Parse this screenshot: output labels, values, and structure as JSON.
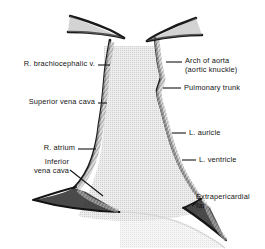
{
  "figure": {
    "type": "anatomical-diagram",
    "background_color": "#ffffff",
    "ink_color": "#141414",
    "lung_field_fill": "#e8e8e8",
    "border_shading": "#9a9a9a"
  },
  "labels": {
    "r_brachiocephalic_vein": {
      "lines": [
        "R. brachiocephalic v."
      ],
      "side": "left"
    },
    "superior_vena_cava": {
      "lines": [
        "Superior vena cava"
      ],
      "side": "left"
    },
    "r_atrium": {
      "lines": [
        "R. atrium"
      ],
      "side": "left"
    },
    "inferior_vena_cava": {
      "lines": [
        "Inferior",
        "vena cava"
      ],
      "side": "left"
    },
    "arch_of_aorta": {
      "lines": [
        "Arch of aorta",
        "(aortic knuckle)"
      ],
      "side": "right"
    },
    "pulmonary_trunk": {
      "lines": [
        "Pulmonary trunk"
      ],
      "side": "right"
    },
    "l_auricle": {
      "lines": [
        "L. auricle"
      ],
      "side": "right"
    },
    "l_ventricle": {
      "lines": [
        "L. ventricle"
      ],
      "side": "right"
    },
    "extrapericardial_fat": {
      "lines": [
        "Extrapericardial",
        "fat"
      ],
      "side": "right"
    }
  },
  "structures": {
    "left_clavicle": "clavicle-left",
    "right_clavicle": "clavicle-right",
    "heart_silhouette": "cardiac-silhouette",
    "diaphragm": "diaphragm-dome"
  }
}
